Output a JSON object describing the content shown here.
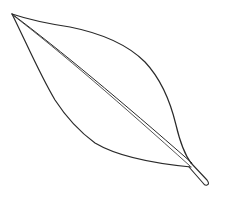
{
  "image": {
    "subject": "leaf line drawing",
    "description": "Black outline sketch of a single lanceolate leaf with a central midrib and short stalk on a white background",
    "colors": {
      "background": "#ffffff",
      "stroke": "#2a2a2a"
    }
  }
}
